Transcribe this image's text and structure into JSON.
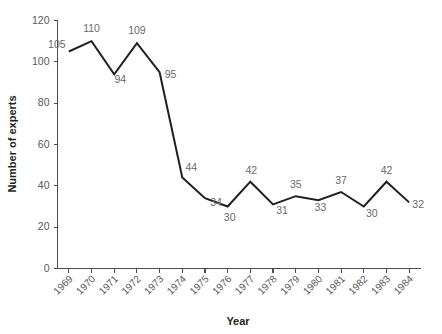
{
  "chart_data": {
    "type": "line",
    "title": "",
    "xlabel": "Year",
    "ylabel": "Number of experts",
    "categories": [
      "1969",
      "1970",
      "1971",
      "1972",
      "1973",
      "1974",
      "1975",
      "1976",
      "1977",
      "1978",
      "1979",
      "1980",
      "1981",
      "1982",
      "1983",
      "1984"
    ],
    "values": [
      105,
      110,
      94,
      109,
      95,
      44,
      34,
      30,
      42,
      31,
      35,
      33,
      37,
      30,
      42,
      32
    ],
    "point_labels": [
      "105",
      "110",
      "94",
      "109",
      "95",
      "44",
      "34",
      "30",
      "42",
      "31",
      "35",
      "33",
      "37",
      "30",
      "42",
      "32"
    ],
    "ylim": [
      0,
      120
    ],
    "yticks": [
      0,
      20,
      40,
      60,
      80,
      100,
      120
    ],
    "ytick_labels": [
      "0",
      "20",
      "40",
      "60",
      "80",
      "100",
      "120"
    ],
    "grid": false,
    "legend": "none",
    "series": [
      {
        "name": "Number of experts",
        "values": [
          105,
          110,
          94,
          109,
          95,
          44,
          34,
          30,
          42,
          31,
          35,
          33,
          37,
          30,
          42,
          32
        ]
      }
    ],
    "colors": {
      "line": "#231f20",
      "axis": "#4d4d4d",
      "tick_text": "#58585a",
      "point_label": "#6a6a6c",
      "axis_title": "#231f20",
      "background": "#ffffff"
    }
  }
}
